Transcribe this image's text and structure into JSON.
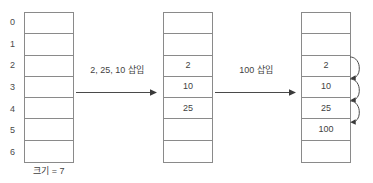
{
  "figure": {
    "title_fragment": "",
    "type": "array-insertion-diagram",
    "ink_color": "#3f3f3f",
    "line_color": "#8a8a8a"
  },
  "arrays": [
    {
      "id": "array-initial",
      "name": "initial-empty-array",
      "size": 7,
      "show_indices": true,
      "indices": [
        "0",
        "1",
        "2",
        "3",
        "4",
        "5",
        "6"
      ],
      "cells": [
        "",
        "",
        "",
        "",
        "",
        "",
        ""
      ],
      "caption": "크기 = 7"
    },
    {
      "id": "array-after-first",
      "name": "array-after-first-insertion",
      "size": 7,
      "show_indices": false,
      "indices": [
        "0",
        "1",
        "2",
        "3",
        "4",
        "5",
        "6"
      ],
      "cells": [
        "",
        "",
        "2",
        "10",
        "25",
        "",
        ""
      ],
      "caption": ""
    },
    {
      "id": "array-after-second",
      "name": "array-after-second-insertion",
      "size": 7,
      "show_indices": false,
      "indices": [
        "0",
        "1",
        "2",
        "3",
        "4",
        "5",
        "6"
      ],
      "cells": [
        "",
        "",
        "2",
        "10",
        "25",
        "100",
        ""
      ],
      "caption": ""
    }
  ],
  "transitions": [
    {
      "id": "transition-1",
      "label": "2, 25, 10 삽입"
    },
    {
      "id": "transition-2",
      "label": "100 삽입"
    }
  ],
  "chain_arrows": {
    "name": "probe-chain-arrows",
    "count": 3,
    "description": "curved arrows linking consecutive occupied slots"
  }
}
